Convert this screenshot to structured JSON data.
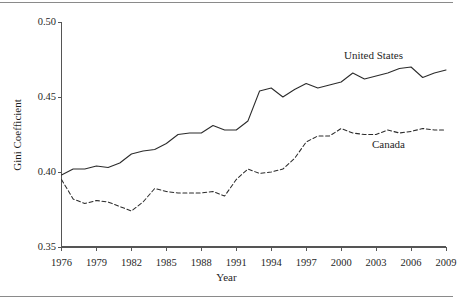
{
  "chart_data": {
    "type": "line",
    "title": "",
    "xlabel": "Year",
    "ylabel": "Gini Coefficient",
    "xlim": [
      1976,
      2009
    ],
    "ylim": [
      0.35,
      0.5
    ],
    "grid": false,
    "legend_position": "inline-annotation",
    "y_ticks": [
      "0.50",
      "0.45",
      "0.40",
      "0.35"
    ],
    "y_tick_values": [
      0.5,
      0.45,
      0.4,
      0.35
    ],
    "x_ticks": [
      "1976",
      "1979",
      "1982",
      "1985",
      "1988",
      "1991",
      "1994",
      "1997",
      "2000",
      "2003",
      "2006",
      "2009"
    ],
    "x_tick_values": [
      1976,
      1979,
      1982,
      1985,
      1988,
      1991,
      1994,
      1997,
      2000,
      2003,
      2006,
      2009
    ],
    "x": [
      1976,
      1977,
      1978,
      1979,
      1980,
      1981,
      1982,
      1983,
      1984,
      1985,
      1986,
      1987,
      1988,
      1989,
      1990,
      1991,
      1992,
      1993,
      1994,
      1995,
      1996,
      1997,
      1998,
      1999,
      2000,
      2001,
      2002,
      2003,
      2004,
      2005,
      2006,
      2007,
      2008,
      2009
    ],
    "series": [
      {
        "name": "United States",
        "style": "solid",
        "color": "#2b2b2b",
        "values": [
          0.398,
          0.402,
          0.402,
          0.404,
          0.403,
          0.406,
          0.412,
          0.414,
          0.415,
          0.419,
          0.425,
          0.426,
          0.426,
          0.431,
          0.428,
          0.428,
          0.434,
          0.454,
          0.456,
          0.45,
          0.455,
          0.459,
          0.456,
          0.458,
          0.46,
          0.466,
          0.462,
          0.464,
          0.466,
          0.469,
          0.47,
          0.463,
          0.466,
          0.468
        ]
      },
      {
        "name": "Canada",
        "style": "dashed",
        "color": "#2b2b2b",
        "values": [
          0.395,
          0.382,
          0.379,
          0.381,
          0.38,
          0.377,
          0.374,
          0.38,
          0.389,
          0.387,
          0.386,
          0.386,
          0.386,
          0.387,
          0.384,
          0.395,
          0.402,
          0.399,
          0.4,
          0.402,
          0.409,
          0.42,
          0.424,
          0.424,
          0.429,
          0.426,
          0.425,
          0.425,
          0.428,
          0.426,
          0.427,
          0.429,
          0.428,
          0.428
        ]
      }
    ],
    "annotations": [
      {
        "text": "United States",
        "series": "United States"
      },
      {
        "text": "Canada",
        "series": "Canada"
      }
    ]
  }
}
